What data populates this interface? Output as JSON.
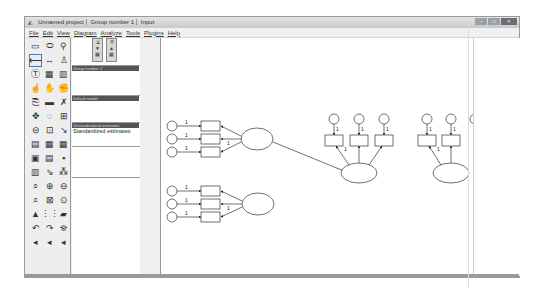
{
  "window": {
    "title_segments": [
      "Unnamed project",
      "Group number 1",
      "Input"
    ],
    "controls": {
      "minimize": "–",
      "maximize": "□",
      "close": "×"
    }
  },
  "menubar": {
    "items": [
      "File",
      "Edit",
      "View",
      "Diagram",
      "Analyze",
      "Tools",
      "Plugins",
      "Help"
    ]
  },
  "toolbox": {
    "tools": [
      {
        "name": "draw-observed-variable-icon",
        "glyph": "▭",
        "selected": false
      },
      {
        "name": "draw-unobserved-variable-icon",
        "glyph": "⬭",
        "selected": false
      },
      {
        "name": "draw-latent-indicator-icon",
        "glyph": "⚲",
        "selected": false
      },
      {
        "name": "draw-path-icon",
        "glyph": "⟵",
        "selected": true
      },
      {
        "name": "draw-covariance-icon",
        "glyph": "↔",
        "selected": false
      },
      {
        "name": "add-unique-variable-icon",
        "glyph": "♙",
        "selected": false
      },
      {
        "name": "figure-caption-icon",
        "glyph": "Ⓣ",
        "selected": false
      },
      {
        "name": "list-variables-model-icon",
        "glyph": "▦",
        "selected": false
      },
      {
        "name": "list-variables-dataset-icon",
        "glyph": "▥",
        "selected": false
      },
      {
        "name": "select-one-icon",
        "glyph": "☝",
        "selected": false
      },
      {
        "name": "select-all-icon",
        "glyph": "✋",
        "selected": false
      },
      {
        "name": "deselect-all-icon",
        "glyph": "✊",
        "selected": false
      },
      {
        "name": "duplicate-icon",
        "glyph": "⎘",
        "selected": false
      },
      {
        "name": "move-icon",
        "glyph": "▬",
        "selected": false
      },
      {
        "name": "erase-icon",
        "glyph": "✗",
        "selected": false
      },
      {
        "name": "change-shape-icon",
        "glyph": "✥",
        "selected": false
      },
      {
        "name": "rotate-icon",
        "glyph": "◌",
        "selected": false
      },
      {
        "name": "reflect-icon",
        "glyph": "⊞",
        "selected": false
      },
      {
        "name": "move-parameter-icon",
        "glyph": "⊖",
        "selected": false
      },
      {
        "name": "scroll-icon",
        "glyph": "⊡",
        "selected": false
      },
      {
        "name": "touch-up-icon",
        "glyph": "↘",
        "selected": false
      },
      {
        "name": "data-files-icon",
        "glyph": "▤",
        "selected": false
      },
      {
        "name": "analysis-properties-icon",
        "glyph": "▦",
        "selected": false
      },
      {
        "name": "calculate-estimates-icon",
        "glyph": "▦",
        "selected": false
      },
      {
        "name": "copy-clipboard-icon",
        "glyph": "▣",
        "selected": false
      },
      {
        "name": "view-text-icon",
        "glyph": "▤",
        "selected": false
      },
      {
        "name": "save-icon",
        "glyph": "▪",
        "selected": false
      },
      {
        "name": "object-properties-icon",
        "glyph": "▥",
        "selected": false
      },
      {
        "name": "drag-properties-icon",
        "glyph": "⇘",
        "selected": false
      },
      {
        "name": "preserve-symmetries-icon",
        "glyph": "⁂",
        "selected": false
      },
      {
        "name": "zoom-selected-icon",
        "glyph": "⌕",
        "selected": false
      },
      {
        "name": "zoom-in-icon",
        "glyph": "⊕",
        "selected": false
      },
      {
        "name": "zoom-out-icon",
        "glyph": "⊖",
        "selected": false
      },
      {
        "name": "zoom-page-icon",
        "glyph": "⌕",
        "selected": false
      },
      {
        "name": "fit-page-icon",
        "glyph": "⊠",
        "selected": false
      },
      {
        "name": "loupe-icon",
        "glyph": "⊙",
        "selected": false
      },
      {
        "name": "degrees-freedom-icon",
        "glyph": "▲",
        "selected": false
      },
      {
        "name": "multiple-group-icon",
        "glyph": "⋮⋮",
        "selected": false
      },
      {
        "name": "print-icon",
        "glyph": "▰",
        "selected": false
      },
      {
        "name": "undo-icon",
        "glyph": "↶",
        "selected": false
      },
      {
        "name": "redo-icon",
        "glyph": "↷",
        "selected": false
      },
      {
        "name": "specification-search-icon",
        "glyph": "⛯",
        "selected": false
      },
      {
        "name": "arrow-left-icon-1",
        "glyph": "◂",
        "selected": false
      },
      {
        "name": "arrow-left-icon-2",
        "glyph": "◂",
        "selected": false
      },
      {
        "name": "arrow-left-icon-3",
        "glyph": "◂",
        "selected": false
      }
    ]
  },
  "panels": {
    "model_buttons": [
      "view-input-path-diagram",
      "view-output-path-diagram"
    ],
    "groups": {
      "header": "Group number 1",
      "items": []
    },
    "models": {
      "header": "Default model",
      "items": []
    },
    "estimates": {
      "header": "Unstandardized estimates",
      "items": [
        "Standardized estimates"
      ]
    }
  },
  "diagram": {
    "factor_loading_label": "1",
    "error_loading_label": "1"
  }
}
